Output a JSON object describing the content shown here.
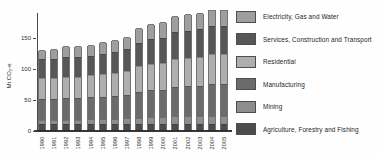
{
  "chart_data": {
    "type": "bar",
    "stacked": true,
    "title": "",
    "xlabel": "",
    "ylabel": "Mt CO₂-e",
    "ylim": [
      0,
      200
    ],
    "y_ticks": [
      0,
      50,
      100,
      150
    ],
    "grid": false,
    "legend_position": "right",
    "categories": [
      "1990",
      "1991",
      "1992",
      "1993",
      "1994",
      "1995",
      "1996",
      "1997",
      "1998",
      "1999",
      "2000",
      "2001",
      "2002",
      "2003",
      "2004",
      "2005"
    ],
    "series": [
      {
        "key": "agriculture",
        "name": "Agriculture, Forestry and Fishing",
        "color": "#4c4c4c",
        "values": [
          9,
          9,
          9,
          9,
          9,
          9,
          9,
          9,
          10,
          10,
          10,
          10,
          10,
          10,
          10,
          10
        ]
      },
      {
        "key": "mining",
        "name": "Mining",
        "color": "#8d8d8d",
        "values": [
          8,
          8,
          8,
          8,
          9,
          9,
          9,
          10,
          10,
          11,
          11,
          12,
          12,
          12,
          13,
          13
        ]
      },
      {
        "key": "manufacturing",
        "name": "Manufacturing",
        "color": "#6b6b6b",
        "values": [
          33,
          34,
          35,
          35,
          35,
          36,
          37,
          38,
          42,
          44,
          44,
          48,
          49,
          50,
          52,
          52
        ]
      },
      {
        "key": "residential",
        "name": "Residential",
        "color": "#aeaeae",
        "values": [
          34,
          34,
          35,
          35,
          36,
          37,
          38,
          39,
          42,
          43,
          44,
          46,
          46,
          47,
          48,
          48
        ]
      },
      {
        "key": "services",
        "name": "Services, Construction and Transport",
        "color": "#575757",
        "values": [
          31,
          31,
          32,
          32,
          32,
          33,
          34,
          35,
          38,
          40,
          41,
          43,
          44,
          45,
          46,
          46
        ]
      },
      {
        "key": "electricity",
        "name": "Electricity, Gas and Water",
        "color": "#9e9e9e",
        "values": [
          15,
          16,
          17,
          18,
          18,
          19,
          20,
          21,
          24,
          24,
          25,
          27,
          27,
          27,
          27,
          27
        ]
      }
    ],
    "legend_order_top_to_bottom": [
      "electricity",
      "services",
      "residential",
      "manufacturing",
      "mining",
      "agriculture"
    ],
    "axis_color": "#4a4a4a",
    "text_color": "#2e2e2e"
  }
}
